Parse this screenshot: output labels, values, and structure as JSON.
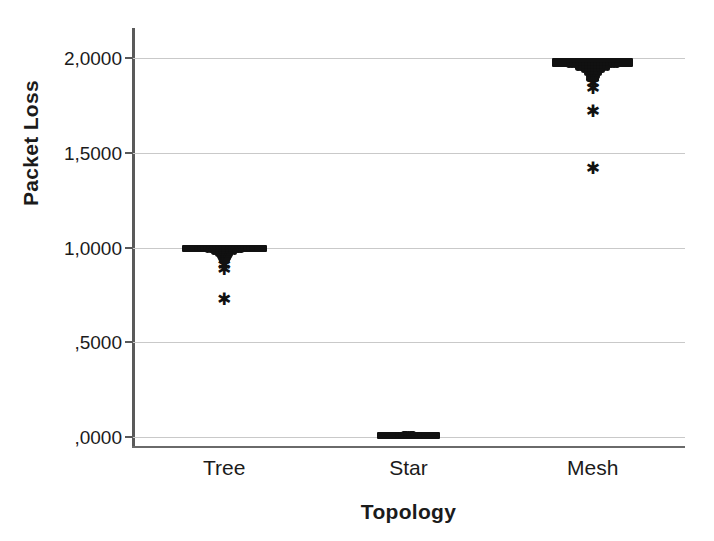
{
  "chart_data": {
    "type": "scatter",
    "title": "",
    "subtitle": "",
    "xlabel": "Topology",
    "ylabel": "Packet Loss",
    "categories": [
      "Tree",
      "Star",
      "Mesh"
    ],
    "x_tick_labels": [
      "Tree",
      "Star",
      "Mesh"
    ],
    "y_tick_labels": [
      ",0000",
      ",5000",
      "1,0000",
      "1,5000",
      "2,0000"
    ],
    "y_tick_values": [
      0.0,
      0.5,
      1.0,
      1.5,
      2.0
    ],
    "ylim": [
      -0.06,
      2.16
    ],
    "grid": "horizontal",
    "legend": "none",
    "decimal_separator": ",",
    "marker_colors": {
      "point": "#111111",
      "outlier": "#111111"
    },
    "axis_color": "#5a5a5a",
    "gridline_color": "#c9c9c9",
    "background_color": "#ffffff",
    "series": [
      {
        "name": "Tree",
        "category_index": 0,
        "center_value": 1.0,
        "dense_band": {
          "from": 0.985,
          "to": 1.005,
          "width_units": 0.46
        },
        "taper": [
          {
            "value": 0.995,
            "spread": 0.3
          },
          {
            "value": 0.985,
            "spread": 0.18
          },
          {
            "value": 0.975,
            "spread": 0.11
          },
          {
            "value": 0.965,
            "spread": 0.07
          },
          {
            "value": 0.955,
            "spread": 0.05
          },
          {
            "value": 0.945,
            "spread": 0.04
          },
          {
            "value": 0.935,
            "spread": 0.03
          }
        ],
        "outliers": [
          0.905,
          0.885,
          0.725
        ]
      },
      {
        "name": "Star",
        "category_index": 1,
        "center_value": 0.0,
        "dense_band": {
          "from": 0.0,
          "to": 0.012,
          "width_units": 0.34
        },
        "taper": [
          {
            "value": 0.01,
            "spread": 0.12
          },
          {
            "value": 0.018,
            "spread": 0.05
          }
        ],
        "outliers": []
      },
      {
        "name": "Mesh",
        "category_index": 2,
        "center_value": 1.98,
        "dense_band": {
          "from": 1.965,
          "to": 1.99,
          "width_units": 0.44
        },
        "taper": [
          {
            "value": 1.965,
            "spread": 0.26
          },
          {
            "value": 1.95,
            "spread": 0.16
          },
          {
            "value": 1.935,
            "spread": 0.1
          },
          {
            "value": 1.92,
            "spread": 0.07
          },
          {
            "value": 1.905,
            "spread": 0.05
          },
          {
            "value": 1.89,
            "spread": 0.04
          }
        ],
        "outliers": [
          1.865,
          1.84,
          1.72,
          1.415
        ]
      }
    ]
  }
}
